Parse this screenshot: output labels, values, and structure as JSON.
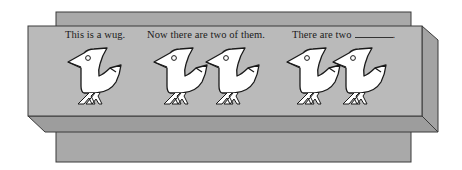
{
  "panels": [
    {
      "caption": "This is a wug.",
      "bird_count": 1
    },
    {
      "caption": "Now there are two of them.",
      "bird_count": 2
    },
    {
      "caption_prefix": "There are two",
      "caption_suffix": ".",
      "blank": true,
      "bird_count": 2
    }
  ],
  "colors": {
    "back_panel": "#a8a8a8",
    "front_face": "#b9b9b9",
    "bottom_face": "#9c9c9c",
    "side_face": "#a2a2a2",
    "outline": "#3a3a3a",
    "bird_fill": "#ffffff",
    "bird_stroke": "#1a1a1a"
  },
  "icons": {
    "bird": "wug-bird-icon"
  }
}
